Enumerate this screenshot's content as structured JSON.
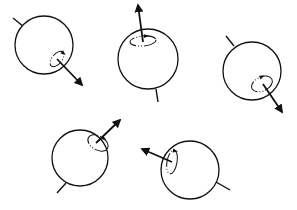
{
  "diagram": {
    "title": "",
    "stroke_color": "#111111",
    "background": "#ffffff",
    "spheres": [
      {
        "id": 1,
        "cx": 44,
        "cy": 45,
        "r": 29,
        "axis_dir": [
          0.7,
          0.71
        ],
        "tail": [
          [
            13,
            18
          ],
          [
            24,
            27
          ]
        ],
        "arrow": [
          [
            57,
            59
          ],
          [
            82,
            85
          ]
        ],
        "loop": {
          "cx": 57,
          "cy": 59,
          "rx": 5,
          "ry": 9,
          "rot": 40
        }
      },
      {
        "id": 2,
        "cx": 148,
        "cy": 59,
        "r": 30,
        "axis_dir": [
          -0.13,
          -0.99
        ],
        "tail": [
          [
            156,
            89
          ],
          [
            158,
            102
          ]
        ],
        "arrow": [
          [
            143,
            42
          ],
          [
            138,
            5
          ]
        ],
        "loop": {
          "cx": 143,
          "cy": 41,
          "rx": 13,
          "ry": 5,
          "rot": -5
        }
      },
      {
        "id": 3,
        "cx": 252,
        "cy": 71,
        "r": 29,
        "axis_dir": [
          0.57,
          0.82
        ],
        "tail": [
          [
            226,
            36
          ],
          [
            234,
            46
          ]
        ],
        "arrow": [
          [
            263,
            84
          ],
          [
            282,
            112
          ]
        ],
        "loop": {
          "cx": 262,
          "cy": 84,
          "rx": 11,
          "ry": 7,
          "rot": -25
        }
      },
      {
        "id": 4,
        "cx": 80,
        "cy": 158,
        "r": 28,
        "axis_dir": [
          0.74,
          -0.67
        ],
        "tail": [
          [
            57,
            193
          ],
          [
            66,
            183
          ]
        ],
        "arrow": [
          [
            96,
            143
          ],
          [
            120,
            120
          ]
        ],
        "loop": {
          "cx": 98,
          "cy": 143,
          "rx": 11,
          "ry": 7,
          "rot": 30
        }
      },
      {
        "id": 5,
        "cx": 190,
        "cy": 170,
        "r": 29,
        "axis_dir": [
          -0.89,
          -0.45
        ],
        "tail": [
          [
            216,
            182
          ],
          [
            230,
            190
          ]
        ],
        "arrow": [
          [
            172,
            162
          ],
          [
            142,
            149
          ]
        ],
        "loop": {
          "cx": 172,
          "cy": 162,
          "rx": 5,
          "ry": 12,
          "rot": 10
        }
      }
    ]
  }
}
